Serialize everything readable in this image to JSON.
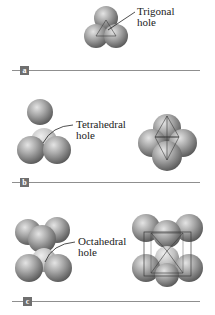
{
  "figure": {
    "panels": [
      {
        "id": "a",
        "badge": "a",
        "label_line1": "Trigonal",
        "label_line2": "hole"
      },
      {
        "id": "b",
        "badge": "b",
        "label_line1": "Tetrahedral",
        "label_line2": "hole"
      },
      {
        "id": "c",
        "badge": "c",
        "label_line1": "Octahedral",
        "label_line2": "hole"
      }
    ],
    "colors": {
      "sphere_light": "#d9d9d9",
      "sphere_mid": "#9a9a9a",
      "sphere_dark": "#5e5e5e",
      "edge_lines": "#3a3a3a",
      "divider": "#8f8f8f",
      "badge": "#6f6f6f"
    }
  }
}
